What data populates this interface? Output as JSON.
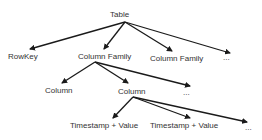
{
  "diagram": {
    "type": "tree",
    "colors": {
      "text": "#333333",
      "arrow": "#1a1a1a",
      "background": "#ffffff"
    },
    "nodes": {
      "table": {
        "label": "Table"
      },
      "rowkey": {
        "label": "RowKey"
      },
      "column_family_1": {
        "label": "Column Family"
      },
      "column_family_2": {
        "label": "Column Family"
      },
      "ellipsis_1": {
        "label": "..."
      },
      "column_1": {
        "label": "Column"
      },
      "column_2": {
        "label": "Column"
      },
      "ellipsis_2": {
        "label": "..."
      },
      "timestamp_value_1": {
        "label": "Timestamp + Value"
      },
      "timestamp_value_2": {
        "label": "Timestamp + Value"
      },
      "ellipsis_3": {
        "label": "..."
      }
    },
    "edges": [
      {
        "from": "table",
        "to": "rowkey"
      },
      {
        "from": "table",
        "to": "column_family_1"
      },
      {
        "from": "table",
        "to": "column_family_2"
      },
      {
        "from": "table",
        "to": "ellipsis_1"
      },
      {
        "from": "column_family_1",
        "to": "column_1"
      },
      {
        "from": "column_family_1",
        "to": "column_2"
      },
      {
        "from": "column_family_1",
        "to": "ellipsis_2"
      },
      {
        "from": "column_2",
        "to": "timestamp_value_1"
      },
      {
        "from": "column_2",
        "to": "timestamp_value_2"
      },
      {
        "from": "column_2",
        "to": "ellipsis_3"
      }
    ]
  }
}
